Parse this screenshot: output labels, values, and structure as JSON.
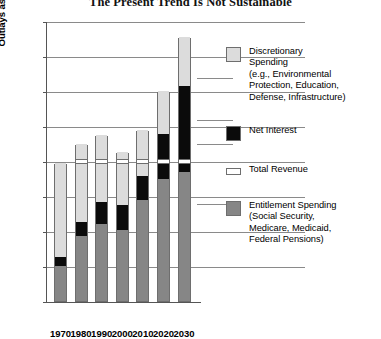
{
  "chart_data": {
    "type": "bar",
    "title": "The Present Trend Is Not Sustainable",
    "xlabel": "",
    "ylabel": "Outlays as a Percentage of Gross Domestic Product",
    "ylim": [
      0,
      40
    ],
    "yticks": [
      0,
      5,
      10,
      15,
      20,
      25,
      30,
      35,
      40
    ],
    "grid": true,
    "legend_position": "right",
    "stacked": true,
    "categories": [
      "1970",
      "1980",
      "1990",
      "2000",
      "2010",
      "2020",
      "2030"
    ],
    "series": [
      {
        "name": "Entitlement Spending",
        "color": "#868686",
        "values": [
          5.0,
          9.3,
          11.0,
          10.1,
          14.4,
          17.5,
          18.4
        ]
      },
      {
        "name": "Net Interest",
        "color": "#0b0b0b",
        "values": [
          1.3,
          2.0,
          3.2,
          3.6,
          3.4,
          6.3,
          12.3
        ]
      },
      {
        "name": "Discretionary Spending",
        "color": "#dcdcdc",
        "values": [
          13.4,
          11.2,
          9.5,
          7.6,
          6.6,
          6.2,
          7.0
        ]
      }
    ],
    "totals": [
      19.7,
      22.5,
      23.7,
      21.3,
      24.4,
      30.0,
      37.7
    ],
    "marker_line": {
      "name": "Total Revenue",
      "color": "#ffffff",
      "value": 20.0
    }
  },
  "axes": {
    "y_title": "Outlays as a Percentage of Gross Domestic Product",
    "y_ticks": [
      "40",
      "35",
      "30",
      "25",
      "20",
      "15",
      "10",
      "5",
      "0"
    ],
    "x_ticks": [
      "1970",
      "1980",
      "1990",
      "2000",
      "2010",
      "2020",
      "2030"
    ]
  },
  "legend": {
    "items": [
      {
        "key": "discretionary",
        "label": "Discretionary\nSpending\n(e.g., Environmental\nProtection, Education,\nDefense, Infrastructure)"
      },
      {
        "key": "interest",
        "label": "Net Interest"
      },
      {
        "key": "revenue",
        "label": "Total Revenue"
      },
      {
        "key": "entitlement",
        "label": "Entitlement Spending\n(Social Security,\nMedicare, Medicaid,\nFederal Pensions)"
      }
    ]
  }
}
